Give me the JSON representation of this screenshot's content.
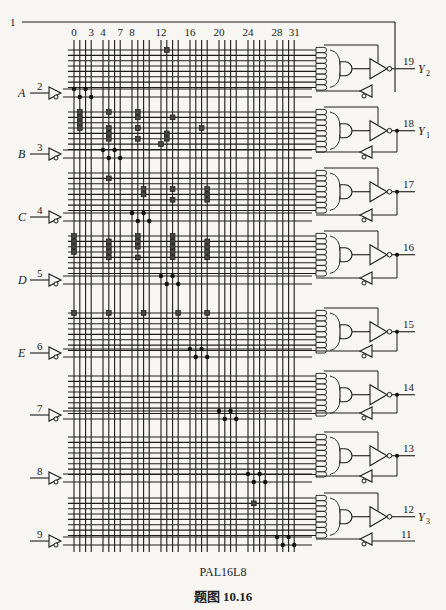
{
  "figure": {
    "device_name": "PAL16L8",
    "caption": "题图 10.16",
    "caption_prefix": "题图",
    "caption_number": "10.16"
  },
  "column_labels": [
    "0",
    "3",
    "4",
    "7",
    "8",
    "12",
    "16",
    "20",
    "24",
    "28",
    "31"
  ],
  "column_label_indices": [
    0,
    3,
    4,
    7,
    8,
    12,
    16,
    20,
    24,
    28,
    31
  ],
  "inputs": [
    {
      "pin": "1",
      "name": ""
    },
    {
      "pin": "2",
      "name": "A"
    },
    {
      "pin": "3",
      "name": "B"
    },
    {
      "pin": "4",
      "name": "C"
    },
    {
      "pin": "5",
      "name": "D"
    },
    {
      "pin": "6",
      "name": "E"
    },
    {
      "pin": "7",
      "name": ""
    },
    {
      "pin": "8",
      "name": ""
    },
    {
      "pin": "9",
      "name": ""
    },
    {
      "pin": "11",
      "name": ""
    }
  ],
  "outputs": [
    {
      "pin": "19",
      "name": "Y",
      "sub": "2"
    },
    {
      "pin": "18",
      "name": "Y",
      "sub": "1"
    },
    {
      "pin": "17",
      "name": "",
      "sub": ""
    },
    {
      "pin": "16",
      "name": "",
      "sub": ""
    },
    {
      "pin": "15",
      "name": "",
      "sub": ""
    },
    {
      "pin": "14",
      "name": "",
      "sub": ""
    },
    {
      "pin": "13",
      "name": "",
      "sub": ""
    },
    {
      "pin": "12",
      "name": "Y",
      "sub": "3"
    }
  ],
  "fuses": [
    {
      "block": 0,
      "row": 0,
      "cols": [
        13
      ]
    },
    {
      "block": 1,
      "row": 0,
      "cols": [
        1,
        5,
        9
      ]
    },
    {
      "block": 1,
      "row": 1,
      "cols": [
        1,
        9,
        14
      ]
    },
    {
      "block": 1,
      "row": 2,
      "cols": [
        1
      ]
    },
    {
      "block": 1,
      "row": 3,
      "cols": [
        1,
        5,
        9,
        18
      ]
    },
    {
      "block": 1,
      "row": 4,
      "cols": [
        5,
        13
      ]
    },
    {
      "block": 1,
      "row": 5,
      "cols": [
        5,
        9,
        13
      ]
    },
    {
      "block": 1,
      "row": 6,
      "cols": [
        12
      ]
    },
    {
      "block": 2,
      "row": 1,
      "cols": [
        5
      ]
    },
    {
      "block": 2,
      "row": 3,
      "cols": [
        10,
        14,
        19
      ]
    },
    {
      "block": 2,
      "row": 4,
      "cols": [
        10,
        19
      ]
    },
    {
      "block": 2,
      "row": 5,
      "cols": [
        14,
        19
      ]
    },
    {
      "block": 3,
      "row": 0,
      "cols": [
        0,
        9,
        14
      ]
    },
    {
      "block": 3,
      "row": 1,
      "cols": [
        0,
        5,
        9,
        14,
        19
      ]
    },
    {
      "block": 3,
      "row": 2,
      "cols": [
        0,
        5,
        9,
        14,
        19
      ]
    },
    {
      "block": 3,
      "row": 3,
      "cols": [
        0,
        5,
        14,
        19
      ]
    },
    {
      "block": 3,
      "row": 4,
      "cols": [
        5,
        9,
        14,
        19
      ]
    },
    {
      "block": 4,
      "row": 0,
      "cols": [
        0,
        5,
        10,
        15,
        19
      ]
    },
    {
      "block": 7,
      "row": 1,
      "cols": [
        25
      ]
    }
  ],
  "input_connections": [
    {
      "row": "A",
      "dots": [
        [
          0,
          0
        ],
        [
          2,
          0
        ],
        [
          1,
          1
        ],
        [
          3,
          1
        ]
      ]
    },
    {
      "row": "B",
      "dots": [
        [
          4,
          0
        ],
        [
          6,
          0
        ],
        [
          5,
          1
        ],
        [
          7,
          1
        ]
      ]
    },
    {
      "row": "C",
      "dots": [
        [
          8,
          0
        ],
        [
          10,
          0
        ],
        [
          9,
          1
        ],
        [
          11,
          1
        ]
      ]
    },
    {
      "row": "D",
      "dots": [
        [
          12,
          0
        ],
        [
          14,
          0
        ],
        [
          13,
          1
        ],
        [
          15,
          1
        ]
      ]
    },
    {
      "row": "E",
      "dots": [
        [
          16,
          0
        ],
        [
          18,
          0
        ],
        [
          17,
          1
        ],
        [
          19,
          1
        ]
      ]
    },
    {
      "row": "7",
      "dots": [
        [
          20,
          0
        ],
        [
          22,
          0
        ],
        [
          21,
          1
        ],
        [
          23,
          1
        ]
      ]
    },
    {
      "row": "8",
      "dots": [
        [
          24,
          0
        ],
        [
          26,
          0
        ],
        [
          25,
          1
        ],
        [
          27,
          1
        ]
      ]
    },
    {
      "row": "9",
      "dots": [
        [
          28,
          0
        ],
        [
          30,
          0
        ],
        [
          29,
          1
        ],
        [
          31,
          1
        ]
      ]
    }
  ],
  "colors": {
    "line": "#1c1c1c",
    "background": "#f7f6f2"
  }
}
